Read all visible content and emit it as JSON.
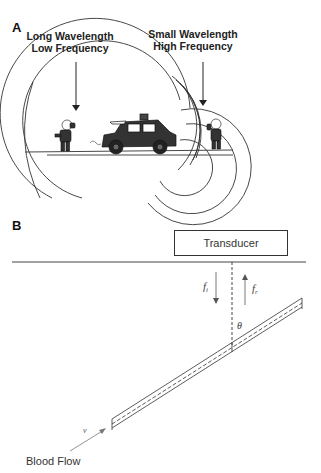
{
  "panel_a": {
    "label": "A",
    "left_caption": {
      "line1": "Long Wavelength",
      "line2": "Low Frequency"
    },
    "right_caption": {
      "line1": "Small Wavelength",
      "line2": "High Frequency"
    },
    "icons": [
      "listener-left-figure",
      "car-siren-figure",
      "listener-right-figure"
    ]
  },
  "panel_b": {
    "label": "B",
    "transducer_label": "Transducer",
    "incident_freq": {
      "symbol": "f",
      "sub": "i"
    },
    "reflected_freq": {
      "symbol": "f",
      "sub": "r"
    },
    "angle_symbol": "θ",
    "velocity_symbol": "v",
    "blood_flow_label": "Blood Flow"
  },
  "colors": {
    "line": "#333333",
    "fill_dark": "#222222",
    "background": "#ffffff"
  }
}
